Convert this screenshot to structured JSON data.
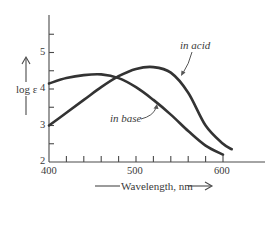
{
  "chart_data": {
    "type": "line",
    "title": "",
    "xlabel": "Wavelength, nm",
    "ylabel": "log ε",
    "xlim": [
      400,
      640
    ],
    "ylim": [
      2,
      6
    ],
    "grid": false,
    "legend": "inline annotations",
    "x_ticks": [
      400,
      420,
      440,
      460,
      480,
      500,
      520,
      540,
      560,
      580,
      600
    ],
    "x_tick_labels": [
      "400",
      "500",
      "600"
    ],
    "y_ticks": [
      2,
      2.5,
      3,
      3.5,
      4,
      4.5,
      5,
      5.5
    ],
    "y_tick_labels": [
      "2",
      "3",
      "4",
      "5"
    ],
    "series": [
      {
        "name": "in acid",
        "x": [
          400,
          420,
          440,
          460,
          480,
          500,
          520,
          540,
          560,
          580,
          600,
          610
        ],
        "values": [
          3.0,
          3.35,
          3.7,
          4.05,
          4.35,
          4.55,
          4.6,
          4.45,
          3.9,
          3.0,
          2.5,
          2.35
        ]
      },
      {
        "name": "in base",
        "x": [
          400,
          420,
          440,
          460,
          480,
          500,
          520,
          540,
          560,
          580,
          600
        ],
        "values": [
          4.15,
          4.3,
          4.38,
          4.4,
          4.3,
          4.05,
          3.7,
          3.3,
          2.85,
          2.45,
          2.2
        ]
      }
    ],
    "annotations": [
      "in acid",
      "in base"
    ]
  },
  "labels": {
    "ylabel": "log ε",
    "xlabel": "Wavelength, nm",
    "y_ticks": [
      "5",
      "4",
      "3",
      "2"
    ],
    "x_ticks": [
      "400",
      "500",
      "600"
    ],
    "acid": "in acid",
    "base": "in base"
  },
  "colors": {
    "ink": "#333333",
    "background": "#ffffff"
  }
}
